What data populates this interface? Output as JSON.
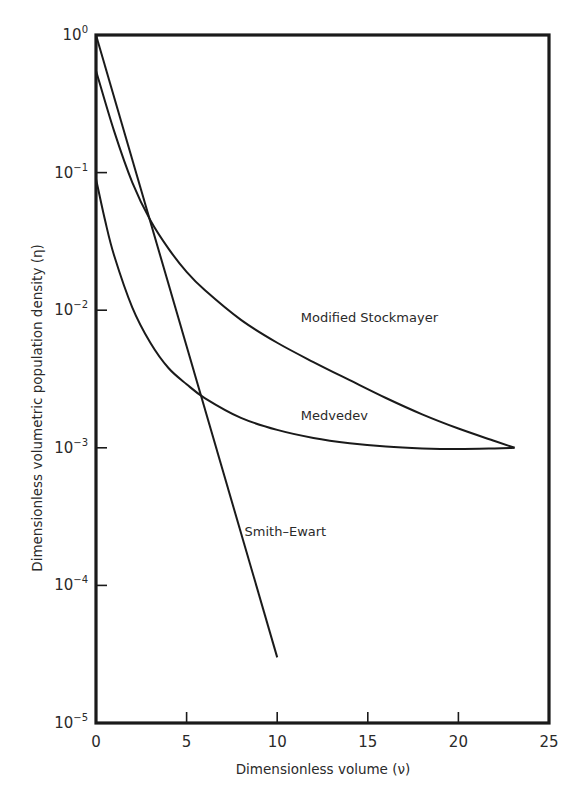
{
  "chart_data": {
    "type": "line",
    "title": "",
    "xlabel": "Dimensionless volume (ν)",
    "ylabel": "Dimensionless volumetric population density (η)",
    "xlim": [
      0,
      25
    ],
    "ylim": [
      1e-05,
      1
    ],
    "yscale": "log",
    "grid": false,
    "legend": "inline labels",
    "x_ticks": [
      0,
      5,
      10,
      15,
      20,
      25
    ],
    "x_tick_labels": [
      "0",
      "5",
      "10",
      "15",
      "20",
      "25"
    ],
    "y_ticks": [
      1,
      0.1,
      0.01,
      0.001,
      0.0001,
      1e-05
    ],
    "y_tick_labels": [
      {
        "base": "10",
        "exp": "0"
      },
      {
        "base": "10",
        "exp": "−1"
      },
      {
        "base": "10",
        "exp": "−2"
      },
      {
        "base": "10",
        "exp": "−3"
      },
      {
        "base": "10",
        "exp": "−4"
      },
      {
        "base": "10",
        "exp": "−5"
      }
    ],
    "series": [
      {
        "name": "Modified Stockmayer",
        "x": [
          0,
          1,
          2,
          3,
          4,
          5,
          6,
          8,
          10,
          12,
          14,
          16,
          18,
          20,
          22,
          23.1
        ],
        "y": [
          0.55,
          0.2,
          0.085,
          0.045,
          0.028,
          0.019,
          0.014,
          0.0085,
          0.0058,
          0.0042,
          0.0031,
          0.0023,
          0.00175,
          0.00138,
          0.00112,
          0.001
        ]
      },
      {
        "name": "Medvedev",
        "x": [
          0,
          0.5,
          1,
          2,
          3,
          4,
          5,
          6,
          8,
          10,
          12,
          14,
          16,
          18,
          20,
          22,
          23.1
        ],
        "y": [
          0.09,
          0.045,
          0.025,
          0.0105,
          0.0058,
          0.0038,
          0.0029,
          0.0023,
          0.00165,
          0.00135,
          0.00118,
          0.00108,
          0.00102,
          0.00099,
          0.00098,
          0.00099,
          0.001
        ]
      },
      {
        "name": "Smith–Ewart",
        "x": [
          0,
          10
        ],
        "y": [
          1,
          3e-05
        ]
      }
    ],
    "annotations": [
      {
        "text": "Modified Stockmayer",
        "x": 11.3,
        "y": 0.0082
      },
      {
        "text": "Medvedev",
        "x": 11.3,
        "y": 0.0016
      },
      {
        "text": "Smith–Ewart",
        "x": 8.2,
        "y": 0.00023
      }
    ]
  }
}
